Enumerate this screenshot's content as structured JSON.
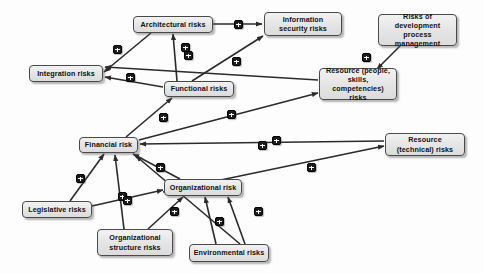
{
  "diagram": {
    "background_color": "#fdfdfd",
    "node_fill_color": "#e4e4e4",
    "node_border_color": "#4a4a4a",
    "edge_color": "#2b2b2b",
    "badge_color": "#1c1c1c",
    "badge_symbol": "+",
    "relation_meaning": "positive influence",
    "nodes": [
      {
        "id": "architectural",
        "label": "Architectural risks",
        "x": 133,
        "y": 16,
        "w": 80,
        "h": 17
      },
      {
        "id": "information_security",
        "label": "Information security risks",
        "x": 264,
        "y": 12,
        "w": 78,
        "h": 24
      },
      {
        "id": "development_process",
        "label": "Risks of development process management",
        "x": 378,
        "y": 14,
        "w": 79,
        "h": 32
      },
      {
        "id": "integration",
        "label": "Integration risks",
        "x": 29,
        "y": 65,
        "w": 74,
        "h": 17
      },
      {
        "id": "functional",
        "label": "Functional risks",
        "x": 164,
        "y": 81,
        "w": 70,
        "h": 16
      },
      {
        "id": "resource_people",
        "label": "Resource (people, skills, competencies) risks",
        "x": 319,
        "y": 68,
        "w": 78,
        "h": 32
      },
      {
        "id": "financial",
        "label": "Financial risk",
        "x": 79,
        "y": 137,
        "w": 59,
        "h": 16
      },
      {
        "id": "resource_technical",
        "label": "Resource (technical) risks",
        "x": 385,
        "y": 133,
        "w": 80,
        "h": 23
      },
      {
        "id": "organizational",
        "label": "Organizational risk",
        "x": 164,
        "y": 179,
        "w": 78,
        "h": 17
      },
      {
        "id": "legislative",
        "label": "Legislative risks",
        "x": 22,
        "y": 201,
        "w": 70,
        "h": 17
      },
      {
        "id": "org_structure",
        "label": "Organizational structure risks",
        "x": 97,
        "y": 229,
        "w": 76,
        "h": 27
      },
      {
        "id": "environmental",
        "label": "Environmental risks",
        "x": 189,
        "y": 244,
        "w": 80,
        "h": 18
      }
    ],
    "edges": [
      {
        "from": "architectural",
        "to": "information_security",
        "sign": "+",
        "badge_x": 234,
        "badge_y": 20,
        "points": "213,24 262,24"
      },
      {
        "from": "architectural",
        "to": "integration",
        "sign": "+",
        "badge_x": 113,
        "badge_y": 45,
        "points": "151,33 104,72"
      },
      {
        "from": "functional",
        "to": "architectural",
        "sign": "+",
        "badge_x": 181,
        "badge_y": 43,
        "points": "177,81 173,34"
      },
      {
        "from": "functional",
        "to": "information_security",
        "sign": "+",
        "badge_x": 184,
        "badge_y": 51,
        "points": "192,81 263,36"
      },
      {
        "from": "resource_people",
        "to": "integration",
        "sign": "+",
        "badge_x": 232,
        "badge_y": 57,
        "points": "318,80 105,67"
      },
      {
        "from": "functional",
        "to": "integration",
        "sign": "+",
        "badge_x": 126,
        "badge_y": 73,
        "points": "163,87 105,77"
      },
      {
        "from": "development_process",
        "to": "resource_people",
        "sign": "+",
        "badge_x": 362,
        "badge_y": 53,
        "points": "400,46 377,69"
      },
      {
        "from": "financial",
        "to": "functional",
        "sign": "+",
        "badge_x": 159,
        "badge_y": 113,
        "points": "126,137 172,98"
      },
      {
        "from": "financial",
        "to": "resource_people",
        "sign": "+",
        "badge_x": 227,
        "badge_y": 110,
        "points": "139,140 318,93"
      },
      {
        "from": "resource_technical",
        "to": "financial",
        "sign": "+",
        "badge_x": 272,
        "badge_y": 136,
        "points": "384,141 140,144"
      },
      {
        "from": "organizational",
        "to": "financial",
        "sign": "+",
        "badge_x": 156,
        "badge_y": 163,
        "points": "180,179 133,154"
      },
      {
        "from": "organizational",
        "to": "resource_technical",
        "sign": "+",
        "badge_x": 307,
        "badge_y": 163,
        "points": "163,192 384,146"
      },
      {
        "from": "legislative",
        "to": "financial",
        "sign": "+",
        "badge_x": 76,
        "badge_y": 174,
        "points": "70,201 104,154"
      },
      {
        "from": "legislative",
        "to": "organizational",
        "sign": "+",
        "badge_x": 118,
        "badge_y": 192,
        "points": "92,206 163,190"
      },
      {
        "from": "org_structure",
        "to": "financial",
        "sign": "+",
        "badge_x": 123,
        "badge_y": 196,
        "points": "124,229 115,155"
      },
      {
        "from": "org_structure",
        "to": "organizational",
        "sign": "+",
        "badge_x": 170,
        "badge_y": 207,
        "points": "148,229 183,197"
      },
      {
        "from": "environmental",
        "to": "organizational",
        "sign": "+",
        "badge_x": 215,
        "badge_y": 217,
        "points": "216,244 205,197"
      },
      {
        "from": "environmental",
        "to": "financial",
        "sign": "+",
        "badge_x": 258,
        "badge_y": 141,
        "points": "240,244 136,156"
      },
      {
        "from": "environmental",
        "to": "organizational",
        "sign": "+",
        "badge_x": 254,
        "badge_y": 207,
        "points": "245,244 228,197"
      }
    ]
  }
}
